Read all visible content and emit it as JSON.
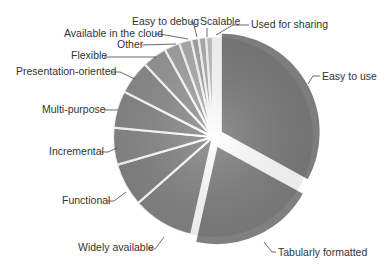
{
  "chart_data": {
    "type": "pie",
    "title": "",
    "start_angle_deg": 0,
    "direction": "clockwise",
    "exploded": [
      "Easy to use",
      "Tabularly formatted"
    ],
    "categories": [
      "Easy to use",
      "Tabularly formatted",
      "Widely available",
      "Functional",
      "Incremental",
      "Multi-purpose",
      "Presentation-oriented",
      "Flexible",
      "Other",
      "Available in the cloud",
      "Easy to debug",
      "Scalable",
      "Used for sharing"
    ],
    "values": [
      33,
      20.5,
      10,
      7,
      6,
      6,
      5.5,
      4,
      2.5,
      2,
      1.2,
      1.2,
      1.1
    ],
    "colors": [
      "#7d7d7d",
      "#808080",
      "#858585",
      "#858585",
      "#8a8a8a",
      "#8a8a8a",
      "#8e8e8e",
      "#999999",
      "#a6a6a6",
      "#b0b0b0",
      "#a8a8a8",
      "#b3b3b3",
      "#c4c4c4"
    ],
    "labels": [
      {
        "text": "Easy to use",
        "x": 322,
        "y": 80,
        "anchor": "start",
        "line": [
          [
            320,
            76
          ],
          [
            313,
            76
          ],
          [
            308,
            84
          ]
        ]
      },
      {
        "text": "Tabularly formatted",
        "x": 278,
        "y": 256,
        "anchor": "start",
        "line": [
          [
            276,
            252
          ],
          [
            272,
            252
          ],
          [
            264,
            242
          ]
        ]
      },
      {
        "text": "Widely available",
        "x": 78,
        "y": 251,
        "anchor": "start",
        "line": [
          [
            148,
            249
          ],
          [
            155,
            249
          ],
          [
            164,
            237
          ]
        ]
      },
      {
        "text": "Functional",
        "x": 62,
        "y": 204,
        "anchor": "start",
        "line": [
          [
            107,
            201
          ],
          [
            114,
            201
          ],
          [
            126,
            192
          ]
        ]
      },
      {
        "text": "Incremental",
        "x": 49,
        "y": 155,
        "anchor": "start",
        "line": [
          [
            101,
            152
          ],
          [
            108,
            152
          ],
          [
            117,
            148
          ]
        ]
      },
      {
        "text": "Multi-purpose",
        "x": 42,
        "y": 113,
        "anchor": "start",
        "line": [
          [
            104,
            110
          ],
          [
            118,
            110
          ]
        ]
      },
      {
        "text": "Presentation-oriented",
        "x": 16,
        "y": 75,
        "anchor": "start",
        "line": [
          [
            111,
            72
          ],
          [
            120,
            72
          ],
          [
            135,
            79
          ]
        ]
      },
      {
        "text": "Flexible",
        "x": 71,
        "y": 59,
        "anchor": "start",
        "line": [
          [
            104,
            57
          ],
          [
            156,
            57
          ]
        ]
      },
      {
        "text": "Other",
        "x": 117,
        "y": 48,
        "anchor": "start",
        "line": [
          [
            142,
            45
          ],
          [
            176,
            44
          ]
        ]
      },
      {
        "text": "Available in the cloud",
        "x": 64,
        "y": 37,
        "anchor": "start",
        "line": [
          [
            155,
            34
          ],
          [
            160,
            34
          ],
          [
            188,
            39
          ]
        ]
      },
      {
        "text": "Easy to debug",
        "x": 132,
        "y": 25,
        "anchor": "start",
        "line": [
          [
            190,
            22
          ],
          [
            193,
            22
          ],
          [
            197,
            37
          ]
        ]
      },
      {
        "text": "Scalable",
        "x": 200,
        "y": 25,
        "anchor": "start",
        "line": [
          [
            207,
            28
          ],
          [
            207,
            37
          ]
        ]
      },
      {
        "text": "Used for sharing",
        "x": 251,
        "y": 28,
        "anchor": "start",
        "line": [
          [
            249,
            25
          ],
          [
            233,
            25
          ],
          [
            216,
            35
          ]
        ]
      }
    ],
    "center": [
      213,
      137
    ],
    "radius": 100,
    "legend": "none (callout labels)"
  }
}
